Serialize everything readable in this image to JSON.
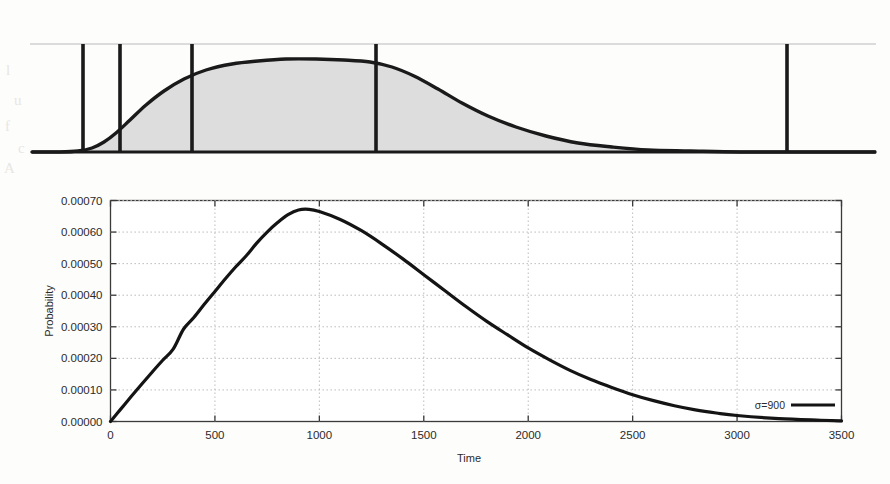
{
  "figure": {
    "top_panel": {
      "name": "schematic-profile-panel",
      "description": "Shaded schematic curve with vertical marker lines",
      "fill_color": "#dcdcdc",
      "line_color": "#1a1a1a",
      "baseline_label": "",
      "marker_count": 5,
      "marker_positions": [
        83,
        120,
        192,
        376,
        787
      ],
      "curve_points": [
        [
          32,
          152
        ],
        [
          60,
          152
        ],
        [
          78,
          151
        ],
        [
          92,
          148
        ],
        [
          104,
          142
        ],
        [
          116,
          133
        ],
        [
          130,
          120
        ],
        [
          146,
          105
        ],
        [
          164,
          91
        ],
        [
          184,
          79
        ],
        [
          206,
          70
        ],
        [
          232,
          64
        ],
        [
          258,
          61
        ],
        [
          286,
          59
        ],
        [
          316,
          59
        ],
        [
          344,
          60
        ],
        [
          370,
          62
        ],
        [
          392,
          67
        ],
        [
          414,
          76
        ],
        [
          438,
          89
        ],
        [
          462,
          103
        ],
        [
          488,
          116
        ],
        [
          516,
          127
        ],
        [
          546,
          136
        ],
        [
          578,
          143
        ],
        [
          612,
          147
        ],
        [
          648,
          150
        ],
        [
          690,
          151
        ],
        [
          740,
          152
        ],
        [
          800,
          152
        ],
        [
          875,
          152
        ]
      ],
      "top_rule_y": 44,
      "baseline_y": 152
    },
    "chart_data": {
      "type": "line",
      "title": "",
      "xlabel": "Time",
      "ylabel": "Probability",
      "xlim": [
        0,
        3500
      ],
      "ylim": [
        0.0,
        0.0007
      ],
      "xticks": [
        0,
        500,
        1000,
        1500,
        2000,
        2500,
        3000,
        3500
      ],
      "xtick_labels": [
        "0",
        "500",
        "1000",
        "1500",
        "2000",
        "2500",
        "3000",
        "3500"
      ],
      "yticks": [
        0.0,
        0.0001,
        0.0002,
        0.0003,
        0.0004,
        0.0005,
        0.0006,
        0.0007
      ],
      "ytick_labels": [
        "0.00000",
        "0.00010",
        "0.00020",
        "0.00030",
        "0.00040",
        "0.00050",
        "0.00060",
        "0.00070"
      ],
      "grid": true,
      "grid_style": "dotted",
      "legend_position": "bottom-right",
      "series": [
        {
          "name": "σ=900",
          "color": "#141414",
          "x": [
            0,
            50,
            100,
            150,
            200,
            250,
            300,
            350,
            400,
            450,
            500,
            550,
            600,
            650,
            700,
            750,
            800,
            850,
            900,
            950,
            1000,
            1100,
            1200,
            1300,
            1400,
            1500,
            1600,
            1700,
            1800,
            1900,
            2000,
            2100,
            2200,
            2300,
            2400,
            2500,
            2600,
            2700,
            2800,
            2900,
            3000,
            3200,
            3400,
            3500
          ],
          "y": [
            0.0,
            4e-05,
            8e-05,
            0.000119,
            0.000157,
            0.000194,
            0.000229,
            0.000293,
            0.00033,
            0.000372,
            0.000412,
            0.000452,
            0.00049,
            0.000525,
            0.000565,
            0.0006,
            0.00063,
            0.000655,
            0.00067,
            0.000672,
            0.000665,
            0.00064,
            0.000605,
            0.000562,
            0.000515,
            0.000465,
            0.000415,
            0.000365,
            0.000318,
            0.000275,
            0.000233,
            0.000196,
            0.000162,
            0.000133,
            0.000108,
            8.5e-05,
            6.6e-05,
            5e-05,
            3.7e-05,
            2.7e-05,
            1.9e-05,
            9e-06,
            4e-06,
            2e-06
          ]
        }
      ],
      "peak": {
        "x": 900,
        "y": 0.00067
      }
    },
    "legend": {
      "entries": [
        {
          "label": "σ=900",
          "swatch": "line",
          "color": "#141414"
        }
      ]
    }
  },
  "ghost_text": {
    "items": [
      "l",
      "u",
      "f",
      "c",
      "A",
      "d",
      "l"
    ]
  }
}
